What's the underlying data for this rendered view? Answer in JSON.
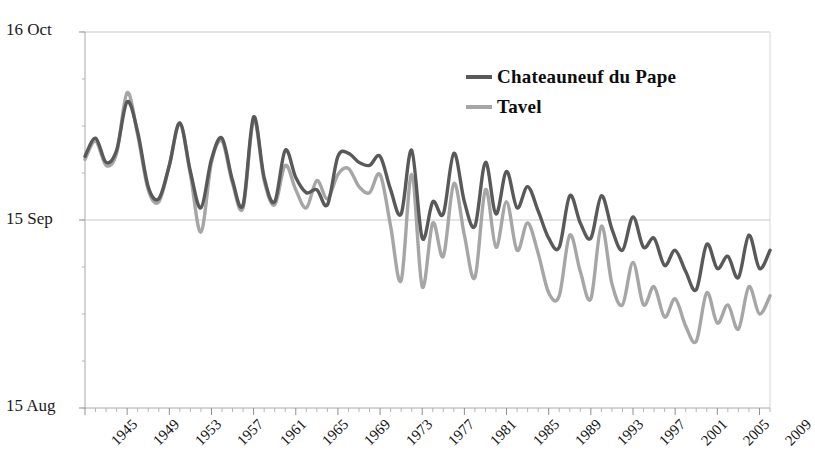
{
  "chart_data": {
    "type": "line",
    "title": "",
    "xlabel": "",
    "ylabel": "",
    "y_tick_labels": [
      "16 Oct",
      "15 Sep",
      "15 Aug"
    ],
    "y_tick_values": [
      92,
      61,
      30
    ],
    "ylim": [
      30,
      92
    ],
    "y_axis_units": "days since 16 July (harvest date)",
    "grid": "horizontal gridline at 15 Sep only",
    "legend_position": "top-right inside plot",
    "x": [
      1945,
      1946,
      1947,
      1948,
      1949,
      1950,
      1951,
      1952,
      1953,
      1954,
      1955,
      1956,
      1957,
      1958,
      1959,
      1960,
      1961,
      1962,
      1963,
      1964,
      1965,
      1966,
      1967,
      1968,
      1969,
      1970,
      1971,
      1972,
      1973,
      1974,
      1975,
      1976,
      1977,
      1978,
      1979,
      1980,
      1981,
      1982,
      1983,
      1984,
      1985,
      1986,
      1987,
      1988,
      1989,
      1990,
      1991,
      1992,
      1993,
      1994,
      1995,
      1996,
      1997,
      1998,
      1999,
      2000,
      2001,
      2002,
      2003,
      2004,
      2005,
      2006,
      2007,
      2008,
      2009,
      2010
    ],
    "x_tick_labels": [
      "1945",
      "1949",
      "1953",
      "1957",
      "1961",
      "1965",
      "1969",
      "1973",
      "1977",
      "1981",
      "1985",
      "1989",
      "1993",
      "1997",
      "2001",
      "2005",
      "2009"
    ],
    "series": [
      {
        "name": "Chateauneuf du Pape",
        "color": "#595959",
        "values": [
          71.5,
          74.5,
          70.5,
          72.5,
          80.5,
          75.5,
          66.5,
          64.5,
          70.0,
          77.0,
          69.0,
          63.0,
          71.0,
          74.5,
          67.5,
          63.5,
          78.0,
          68.0,
          64.0,
          72.5,
          68.0,
          65.5,
          66.0,
          63.5,
          71.5,
          72.0,
          70.5,
          70.0,
          71.5,
          66.0,
          62.0,
          72.5,
          58.0,
          64.0,
          62.0,
          72.0,
          64.0,
          60.0,
          70.5,
          62.0,
          69.0,
          63.0,
          66.5,
          62.5,
          58.0,
          56.5,
          65.0,
          60.5,
          58.0,
          65.0,
          59.5,
          56.0,
          61.5,
          56.5,
          58.0,
          53.5,
          56.0,
          52.5,
          49.5,
          57.0,
          53.0,
          55.0,
          51.5,
          58.5,
          53.0,
          56.0
        ]
      },
      {
        "name": "Tavel",
        "color": "#a6a6a6",
        "values": [
          71.0,
          74.0,
          70.0,
          72.0,
          82.0,
          75.0,
          66.0,
          64.0,
          70.0,
          77.0,
          68.5,
          59.0,
          70.5,
          74.0,
          67.0,
          63.0,
          77.5,
          67.5,
          63.5,
          70.0,
          66.0,
          63.0,
          67.5,
          64.5,
          68.5,
          69.5,
          66.5,
          65.5,
          68.5,
          60.0,
          51.0,
          68.5,
          50.0,
          60.5,
          55.0,
          67.0,
          58.5,
          51.5,
          66.0,
          56.5,
          64.0,
          56.0,
          60.5,
          55.5,
          49.0,
          48.5,
          58.5,
          52.5,
          48.0,
          60.0,
          50.5,
          47.0,
          54.0,
          47.0,
          50.0,
          45.0,
          48.0,
          43.5,
          41.0,
          49.0,
          44.0,
          47.0,
          43.0,
          50.0,
          45.5,
          48.5
        ]
      }
    ]
  },
  "legend": {
    "items": [
      {
        "label": "Chateauneuf du Pape",
        "color": "#595959"
      },
      {
        "label": "Tavel",
        "color": "#a6a6a6"
      }
    ]
  },
  "axes": {
    "top_label": "16 Oct",
    "mid_label": "15 Sep",
    "bottom_label": "15 Aug"
  }
}
